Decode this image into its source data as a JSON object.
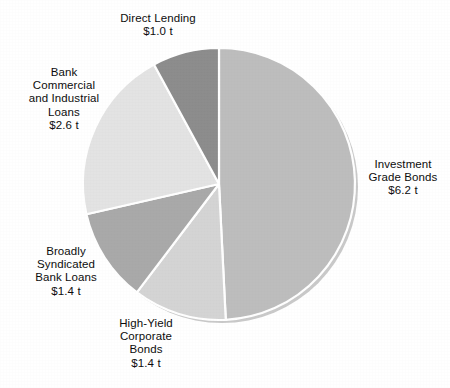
{
  "chart_data": {
    "type": "pie",
    "title": "",
    "unit": "$ trillions",
    "total": 12.6,
    "legend_position": "outside-labels",
    "grid": false,
    "start_angle_deg": 0,
    "direction": "clockwise",
    "categories": [
      "Investment Grade Bonds",
      "High-Yield Corporate Bonds",
      "Broadly Syndicated Bank Loans",
      "Bank Commercial and Industrial Loans",
      "Direct Lending"
    ],
    "values": [
      6.2,
      1.4,
      1.4,
      2.6,
      1.0
    ],
    "value_labels": [
      "$6.2 t",
      "$1.4 t",
      "$1.4 t",
      "$2.6 t",
      "$1.0 t"
    ],
    "colors": [
      "#bdbdbd",
      "#d4d4d4",
      "#a9a9a9",
      "#e3e3e3",
      "#8c8c8c"
    ],
    "slices": [
      {
        "name": "Investment Grade Bonds",
        "label_lines": "Investment\nGrade Bonds\n$6.2 t",
        "value": 6.2,
        "value_label": "$6.2 t",
        "angle_deg": 177.1,
        "color": "#bdbdbd"
      },
      {
        "name": "High-Yield Corporate Bonds",
        "label_lines": "High-Yield\nCorporate\nBonds\n$1.4 t",
        "value": 1.4,
        "value_label": "$1.4 t",
        "angle_deg": 40.0,
        "color": "#d4d4d4"
      },
      {
        "name": "Broadly Syndicated Bank Loans",
        "label_lines": "Broadly\nSyndicated\nBank Loans\n$1.4 t",
        "value": 1.4,
        "value_label": "$1.4 t",
        "angle_deg": 40.0,
        "color": "#a9a9a9"
      },
      {
        "name": "Bank Commercial and Industrial Loans",
        "label_lines": "Bank\nCommercial\nand Industrial\nLoans\n$2.6 t",
        "value": 2.6,
        "value_label": "$2.6 t",
        "angle_deg": 74.3,
        "color": "#e3e3e3"
      },
      {
        "name": "Direct Lending",
        "label_lines": "Direct Lending\n$1.0 t",
        "value": 1.0,
        "value_label": "$1.0 t",
        "angle_deg": 28.6,
        "color": "#8c8c8c"
      }
    ]
  },
  "geometry": {
    "center_x": 219,
    "center_y": 184,
    "radius": 136,
    "separator_color": "#ffffff",
    "shadow_color": "#c9c9c9",
    "background": "#ffffff"
  }
}
